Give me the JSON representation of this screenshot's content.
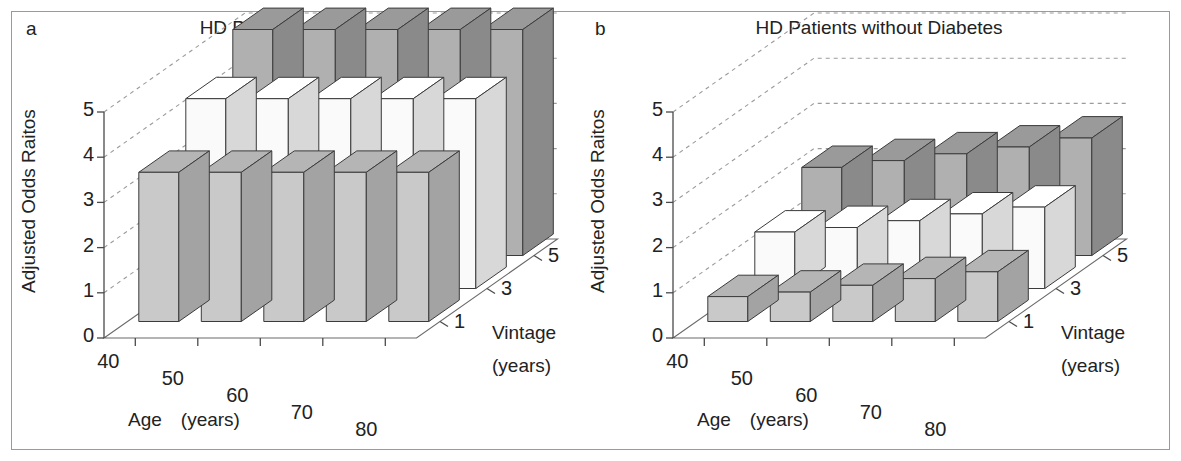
{
  "figure": {
    "panels": [
      {
        "letter": "a",
        "title": "HD Patients with Diabetes",
        "ylabel": "Adjusted Odds Raitos",
        "xlabel": "Age　(years)",
        "zlabel_line1": "Vintage",
        "zlabel_line2": "(years)"
      },
      {
        "letter": "b",
        "title": "HD Patients without Diabetes",
        "ylabel": "Adjusted Odds Raitos",
        "xlabel": "Age　(years)",
        "zlabel_line1": "Vintage",
        "zlabel_line2": "(years)"
      }
    ],
    "yticks": [
      "5",
      "4",
      "3",
      "2",
      "1",
      "0"
    ],
    "xticks": [
      "40",
      "50",
      "60",
      "70",
      "80"
    ],
    "zticks": [
      "5",
      "3",
      "1"
    ]
  },
  "colors": {
    "vintage1_front": "#c9c9c9",
    "vintage1_side": "#a3a3a3",
    "vintage1_top": "#b5b5b5",
    "vintage3_front": "#fafafa",
    "vintage3_side": "#d8d8d8",
    "vintage3_top": "#ffffff",
    "vintage5_front": "#b0b0b0",
    "vintage5_side": "#8a8a8a",
    "vintage5_top": "#9a9a9a",
    "axis": "#4a4a4a",
    "grid": "#9b9b9b",
    "text": "#1a1a1a",
    "frame": "#9a9a9a"
  },
  "chart_data": [
    {
      "type": "bar",
      "title": "HD Patients with Diabetes",
      "panel": "a",
      "xlabel": "Age (years)",
      "ylabel": "Adjusted Odds Raitos",
      "zlabel": "Vintage (years)",
      "categories": [
        "40",
        "50",
        "60",
        "70",
        "80"
      ],
      "ylim": [
        0,
        5
      ],
      "grid": true,
      "legend": "none",
      "series": [
        {
          "name": "1",
          "vintage": 1,
          "values": [
            3.3,
            3.3,
            3.3,
            3.3,
            3.3
          ]
        },
        {
          "name": "3",
          "vintage": 3,
          "values": [
            4.2,
            4.2,
            4.2,
            4.2,
            4.2
          ]
        },
        {
          "name": "5",
          "vintage": 5,
          "values": [
            5.0,
            5.0,
            5.0,
            5.0,
            5.0
          ]
        }
      ]
    },
    {
      "type": "bar",
      "title": "HD Patients without Diabetes",
      "panel": "b",
      "xlabel": "Age (years)",
      "ylabel": "Adjusted Odds Raitos",
      "zlabel": "Vintage (years)",
      "categories": [
        "40",
        "50",
        "60",
        "70",
        "80"
      ],
      "ylim": [
        0,
        5
      ],
      "grid": true,
      "legend": "none",
      "series": [
        {
          "name": "1",
          "vintage": 1,
          "values": [
            0.55,
            0.65,
            0.8,
            0.95,
            1.1
          ]
        },
        {
          "name": "3",
          "vintage": 3,
          "values": [
            1.25,
            1.35,
            1.5,
            1.65,
            1.8
          ]
        },
        {
          "name": "5",
          "vintage": 5,
          "values": [
            1.95,
            2.1,
            2.25,
            2.4,
            2.6
          ]
        }
      ]
    }
  ]
}
